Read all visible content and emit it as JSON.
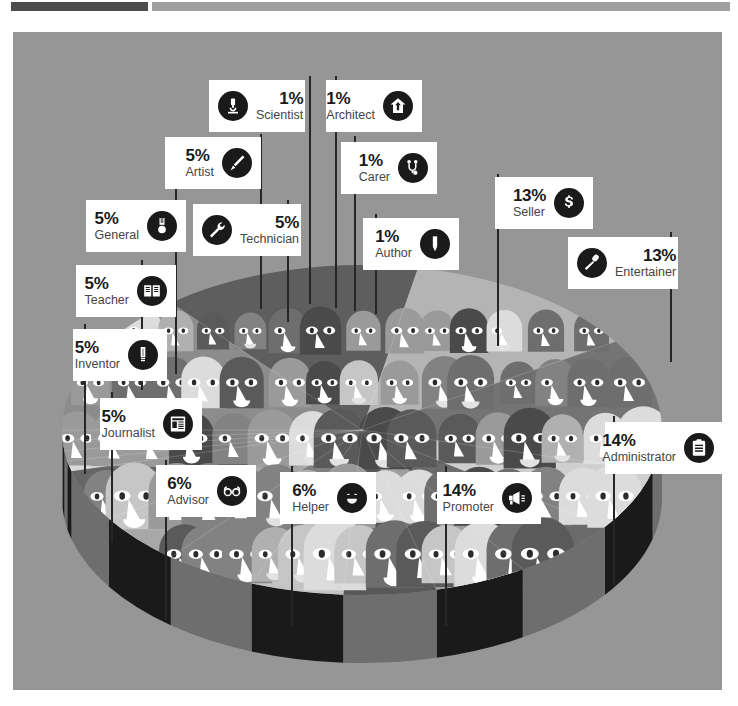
{
  "header": {
    "bar_dark_color": "#4d4d4d",
    "bar_light_color": "#a0a0a0"
  },
  "panel": {
    "background_color": "#969696"
  },
  "chart_data": {
    "type": "pie",
    "title": "",
    "subtitle": "",
    "xlabel": "",
    "ylabel": "",
    "legend_position": "callouts",
    "grid": false,
    "style": "3d-pie-illustrated-faces",
    "unit": "%",
    "categories": [
      "Administrator",
      "Promoter",
      "Seller",
      "Entertainer",
      "Helper",
      "Advisor",
      "Journalist",
      "Inventor",
      "Teacher",
      "General",
      "Technician",
      "Artist",
      "Scientist",
      "Architect",
      "Carer",
      "Author"
    ],
    "values": [
      14,
      14,
      13,
      13,
      6,
      6,
      5,
      5,
      5,
      5,
      5,
      5,
      1,
      1,
      1,
      1
    ],
    "slice_colors": [
      "#8c8c8c",
      "#5e5e5e",
      "#b4b4b4",
      "#747474",
      "#cfcfcf",
      "#6b6b6b",
      "#9e9e9e",
      "#585858",
      "#c3c3c3",
      "#808080",
      "#a8a8a8",
      "#666666",
      "#dadada",
      "#909090",
      "#7a7a7a",
      "#b9b9b9"
    ],
    "side_wall_colors": [
      "#1a1a1a",
      "#6e6e6e"
    ]
  },
  "callouts": [
    {
      "id": "scientist",
      "pct": "1%",
      "name": "Scientist",
      "icon": "microscope-icon",
      "icon_side": "left",
      "x": 196,
      "y": 48,
      "w": 96,
      "h": 52,
      "stem_x": 296,
      "stem_y": 44,
      "stem_h": 228
    },
    {
      "id": "architect",
      "pct": "1%",
      "name": "Architect",
      "icon": "house-arrow-icon",
      "icon_side": "right",
      "x": 313,
      "y": 48,
      "w": 96,
      "h": 52,
      "stem_x": 322,
      "stem_y": 44,
      "stem_h": 232
    },
    {
      "id": "artist",
      "pct": "5%",
      "name": "Artist",
      "icon": "paintbrush-icon",
      "icon_side": "right",
      "x": 152,
      "y": 105,
      "w": 96,
      "h": 52,
      "stem_x": 247,
      "stem_y": 102,
      "stem_h": 175
    },
    {
      "id": "carer",
      "pct": "1%",
      "name": "Carer",
      "icon": "stethoscope-icon",
      "icon_side": "right",
      "x": 328,
      "y": 110,
      "w": 96,
      "h": 52,
      "stem_x": 341,
      "stem_y": 104,
      "stem_h": 175
    },
    {
      "id": "seller",
      "pct": "13%",
      "name": "Seller",
      "icon": "dollar-icon",
      "icon_side": "right",
      "x": 482,
      "y": 145,
      "w": 98,
      "h": 52,
      "stem_x": 484,
      "stem_y": 142,
      "stem_h": 172
    },
    {
      "id": "general",
      "pct": "5%",
      "name": "General",
      "icon": "medal-icon",
      "icon_side": "right",
      "x": 73,
      "y": 168,
      "w": 100,
      "h": 52,
      "stem_x": 162,
      "stem_y": 152,
      "stem_h": 190
    },
    {
      "id": "technician",
      "pct": "5%",
      "name": "Technician",
      "icon": "wrench-icon",
      "icon_side": "left",
      "x": 180,
      "y": 172,
      "w": 108,
      "h": 52,
      "stem_x": 274,
      "stem_y": 168,
      "stem_h": 122
    },
    {
      "id": "author",
      "pct": "1%",
      "name": "Author",
      "icon": "pencil-icon",
      "icon_side": "right",
      "x": 350,
      "y": 186,
      "w": 96,
      "h": 52,
      "stem_x": 362,
      "stem_y": 182,
      "stem_h": 100
    },
    {
      "id": "entertainer",
      "pct": "13%",
      "name": "Entertainer",
      "icon": "microphone-icon",
      "icon_side": "left",
      "x": 555,
      "y": 205,
      "w": 110,
      "h": 52,
      "stem_x": 657,
      "stem_y": 200,
      "stem_h": 130
    },
    {
      "id": "teacher",
      "pct": "5%",
      "name": "Teacher",
      "icon": "book-icon",
      "icon_side": "right",
      "x": 63,
      "y": 233,
      "w": 100,
      "h": 52,
      "stem_x": 128,
      "stem_y": 228,
      "stem_h": 130
    },
    {
      "id": "inventor",
      "pct": "5%",
      "name": "Inventor",
      "icon": "lightbulb-icon",
      "icon_side": "right",
      "x": 60,
      "y": 297,
      "w": 94,
      "h": 52,
      "stem_x": 71,
      "stem_y": 292,
      "stem_h": 150
    },
    {
      "id": "journalist",
      "pct": "5%",
      "name": "Journalist",
      "icon": "newspaper-icon",
      "icon_side": "right",
      "x": 87,
      "y": 366,
      "w": 102,
      "h": 52,
      "stem_x": 98,
      "stem_y": 360,
      "stem_h": 150
    },
    {
      "id": "advisor",
      "pct": "6%",
      "name": "Advisor",
      "icon": "glasses-icon",
      "icon_side": "right",
      "x": 143,
      "y": 433,
      "w": 100,
      "h": 52,
      "stem_x": 152,
      "stem_y": 428,
      "stem_h": 160
    },
    {
      "id": "helper",
      "pct": "6%",
      "name": "Helper",
      "icon": "smiley-icon",
      "icon_side": "right",
      "x": 267,
      "y": 440,
      "w": 96,
      "h": 52,
      "stem_x": 278,
      "stem_y": 434,
      "stem_h": 160
    },
    {
      "id": "promoter",
      "pct": "14%",
      "name": "Promoter",
      "icon": "megaphone-icon",
      "icon_side": "right",
      "x": 424,
      "y": 440,
      "w": 104,
      "h": 52,
      "stem_x": 432,
      "stem_y": 434,
      "stem_h": 160
    },
    {
      "id": "administrator",
      "pct": "14%",
      "name": "Administrator",
      "icon": "clipboard-icon",
      "icon_side": "right",
      "x": 592,
      "y": 390,
      "w": 118,
      "h": 52,
      "stem_x": 600,
      "stem_y": 384,
      "stem_h": 170
    }
  ]
}
